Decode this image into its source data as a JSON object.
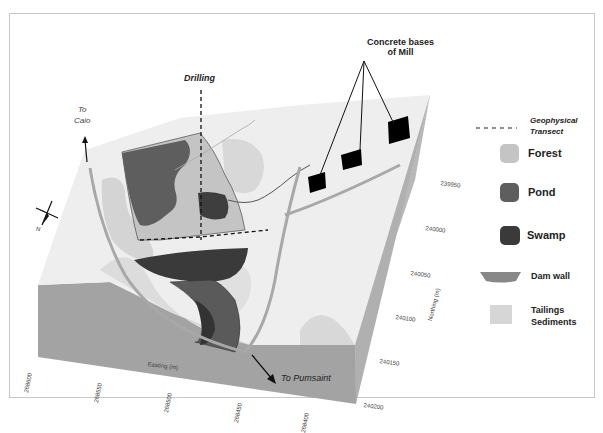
{
  "figure": {
    "labels": {
      "drilling": "Drilling",
      "concrete_bases": "Concrete bases",
      "concrete_bases_line2": "of Mill",
      "to_caio_line1": "To",
      "to_caio_line2": "Caio",
      "to_pumsaint": "To  Pumsaint",
      "compass_north": "N"
    },
    "axes": {
      "easting": {
        "label": "Easting (m)",
        "ticks": [
          "268600",
          "268550",
          "268500",
          "268450",
          "268400"
        ]
      },
      "northing": {
        "label": "Northing (m)",
        "ticks": [
          "239950",
          "240000",
          "240050",
          "240100",
          "240150",
          "240200"
        ]
      }
    },
    "legend": {
      "items": [
        {
          "label": "Geophysical",
          "label2": "Transect",
          "symbol": "dashed-line",
          "color": "#333333"
        },
        {
          "label": "Forest",
          "symbol": "rounded-square",
          "color": "#c4c4c4"
        },
        {
          "label": "Pond",
          "symbol": "rounded-square",
          "color": "#5e5e5e"
        },
        {
          "label": "Swamp",
          "symbol": "rounded-square",
          "color": "#3a3a3a"
        },
        {
          "label": "Dam wall",
          "symbol": "trapezoid",
          "color": "#888888"
        },
        {
          "label": "Tailings",
          "label2": "Sediments",
          "symbol": "square",
          "color": "#d6d6d6"
        }
      ]
    },
    "colors": {
      "block_side": "#a3a3a3",
      "block_right": "#b8b8b8",
      "surface": "#efefef",
      "tailings": "#d6d6d6",
      "forest": "#c4c4c4",
      "pond": "#5e5e5e",
      "swamp": "#3a3a3a",
      "road": "#a8a8a8",
      "mill_base": "#000000"
    },
    "caption": ""
  }
}
